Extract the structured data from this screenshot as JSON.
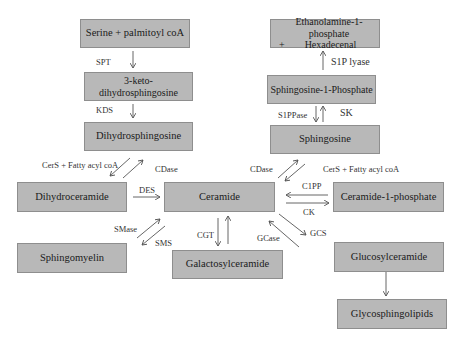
{
  "boxes": {
    "serine": "Serine + palmitoyl coA",
    "keto": "3-keto-dihydrosphingosine",
    "dihydrosphingosine": "Dihydrosphingosine",
    "ethanolamine_line1": "Ethanolamine-1-phosphate",
    "ethanolamine_line2": "+        Hexadecenal",
    "s1p": "Sphingosine-1-Phosphate",
    "sphingosine": "Sphingosine",
    "dihydroceramide": "Dihydroceramide",
    "ceramide": "Ceramide",
    "c1p": "Ceramide-1-phosphate",
    "sphingomyelin": "Sphingomyelin",
    "galactosylceramide": "Galactosylceramide",
    "glucosylceramide": "Glucosylceramide",
    "glycosphingolipids": "Glycosphingolipids"
  },
  "enzymes": {
    "spt": "SPT",
    "kds": "KDS",
    "s1p_lyase": "S1P lyase",
    "s1ppase": "S1PPase",
    "sk": "SK",
    "cers_left": "CerS +  Fatty acyl coA",
    "cdase_left": "CDase",
    "cdase_right": "CDase",
    "cers_right": "CerS + Fatty acyl coA",
    "des": "DES",
    "c1pp": "C1PP",
    "ck": "CK",
    "smase": "SMase",
    "sms": "SMS",
    "cgt": "CGT",
    "gcase": "GCase",
    "gcs": "GCS"
  },
  "colors": {
    "box_fill": "#b8b8b8",
    "box_border": "#8e8e8e",
    "arrow": "#555555"
  }
}
